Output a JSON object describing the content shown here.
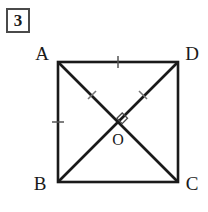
{
  "problem": {
    "number": "3"
  },
  "figure": {
    "type": "geometry-diagram",
    "shape": "square-with-diagonals",
    "stroke_color": "#1a1a1a",
    "background_color": "#ffffff",
    "square": {
      "left": 58,
      "top": 62,
      "right": 178,
      "bottom": 182
    },
    "vertices": [
      {
        "name": "A",
        "position": "top-left",
        "x": 58,
        "y": 62,
        "label_x": 42,
        "label_y": 60
      },
      {
        "name": "D",
        "position": "top-right",
        "x": 178,
        "y": 62,
        "label_x": 182,
        "label_y": 60
      },
      {
        "name": "B",
        "position": "bottom-left",
        "x": 58,
        "y": 182,
        "label_x": 40,
        "label_y": 190
      },
      {
        "name": "C",
        "position": "bottom-right",
        "x": 178,
        "y": 182,
        "label_x": 182,
        "label_y": 190
      }
    ],
    "center": {
      "name": "O",
      "x": 118,
      "y": 122,
      "label_x": 112,
      "label_y": 145
    },
    "diagonals": [
      {
        "from": "A",
        "to": "C"
      },
      {
        "from": "B",
        "to": "D"
      }
    ],
    "right_angle_marker": {
      "at": "O",
      "x": 122,
      "y": 118,
      "size": 7
    },
    "tick_marks": [
      {
        "on": "AD-top-edge",
        "x": 118,
        "y": 62,
        "orientation": "vertical"
      },
      {
        "on": "AB-left-edge",
        "x": 58,
        "y": 122,
        "orientation": "horizontal"
      },
      {
        "on": "AC-diagonal",
        "x": 92,
        "y": 95,
        "orientation": "perpendicular"
      },
      {
        "on": "BD-diagonal",
        "x": 143,
        "y": 95,
        "orientation": "perpendicular"
      }
    ]
  }
}
